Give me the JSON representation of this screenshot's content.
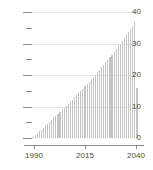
{
  "chart_data": {
    "type": "bar",
    "title": "",
    "subtitle": "",
    "xlabel": "",
    "ylabel": "",
    "grid": true,
    "legend": null,
    "xlim": [
      1989,
      2041
    ],
    "ylim": [
      0,
      40
    ],
    "y_major_ticks": [
      0,
      10,
      20,
      30,
      40
    ],
    "y_minor_ticks": [
      5,
      15,
      25,
      35
    ],
    "y_tick_labels": [
      "0",
      "10",
      "20",
      "30",
      "40"
    ],
    "x_tick_values": [
      1990,
      2015,
      2040
    ],
    "x_tick_labels": [
      "1990",
      "2015",
      "2040"
    ],
    "colors": {
      "bar": "#c4c4c4",
      "grid": "#e3e3e3",
      "axis": "#8a8a8a",
      "text": "#4a4a4a",
      "background": "#ffffff"
    },
    "categories": [
      1990,
      1991,
      1992,
      1993,
      1994,
      1995,
      1996,
      1997,
      1998,
      1999,
      2000,
      2001,
      2002,
      2003,
      2004,
      2005,
      2006,
      2007,
      2008,
      2009,
      2010,
      2011,
      2012,
      2013,
      2014,
      2015,
      2016,
      2017,
      2018,
      2019,
      2020,
      2021,
      2022,
      2023,
      2024,
      2025,
      2026,
      2027,
      2028,
      2029,
      2030,
      2031,
      2032,
      2033,
      2034,
      2035,
      2036,
      2037,
      2038,
      2039,
      2040
    ],
    "values": [
      0.3,
      0.9,
      1.5,
      2.1,
      2.7,
      3.3,
      3.9,
      4.5,
      5.1,
      5.7,
      6.4,
      7.0,
      7.6,
      8.3,
      8.9,
      9.6,
      10.2,
      10.9,
      11.5,
      12.2,
      12.9,
      13.6,
      14.3,
      15.0,
      15.7,
      16.4,
      17.1,
      17.8,
      18.6,
      19.3,
      20.1,
      20.8,
      21.6,
      22.4,
      23.2,
      24.0,
      24.8,
      25.6,
      26.5,
      27.3,
      28.2,
      29.1,
      30.0,
      30.9,
      31.8,
      32.8,
      33.7,
      34.7,
      35.7,
      36.8,
      16.0
    ]
  }
}
